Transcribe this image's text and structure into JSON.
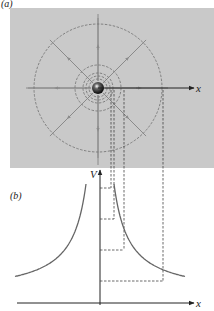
{
  "panel_a": {
    "label": "(a)",
    "background": "#c9c9c9",
    "rect": {
      "x": 10,
      "y": 8,
      "w": 204,
      "h": 160
    },
    "center": {
      "x": 98,
      "y": 88
    },
    "axis_label": "x",
    "equipotential_radii": [
      64,
      23,
      15,
      12,
      9
    ],
    "field_line_color": "#8a8a8a",
    "circle_color": "#777777"
  },
  "panel_b": {
    "label": "(b)",
    "y_axis_label": "V",
    "x_axis_label": "x",
    "origin": {
      "x": 100,
      "y": 303
    },
    "curve_color": "#666666",
    "horizontal_levels": [
      188,
      219,
      250,
      281
    ]
  },
  "projection_lines_x": [
    111,
    114,
    124,
    163
  ]
}
